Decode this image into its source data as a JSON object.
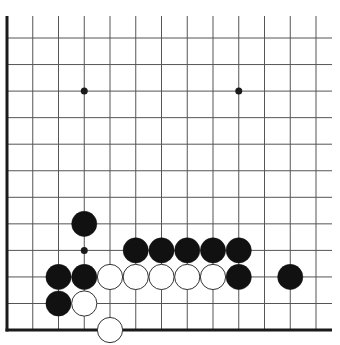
{
  "diagram": {
    "type": "go-board-fragment",
    "colors": {
      "background": "#ffffff",
      "line": "#555555",
      "edge": "#1a1a1a",
      "black_stone": "#111111",
      "white_stone": "#ffffff",
      "white_outline": "#333333"
    },
    "grid": {
      "x0": 7,
      "dx": 25.75,
      "cols": 13,
      "y0": 38,
      "dy": 26.55,
      "rows": 12,
      "top_extend": 16,
      "right_extend": 332
    },
    "star_points": [
      {
        "col": 3,
        "row": 2
      },
      {
        "col": 9,
        "row": 2
      },
      {
        "col": 3,
        "row": 8
      }
    ],
    "stones": [
      {
        "color": "black",
        "col": 3,
        "row": 7
      },
      {
        "color": "black",
        "col": 5,
        "row": 8
      },
      {
        "color": "black",
        "col": 6,
        "row": 8
      },
      {
        "color": "black",
        "col": 7,
        "row": 8
      },
      {
        "color": "black",
        "col": 8,
        "row": 8
      },
      {
        "color": "black",
        "col": 9,
        "row": 8
      },
      {
        "color": "black",
        "col": 2,
        "row": 9
      },
      {
        "color": "black",
        "col": 3,
        "row": 9
      },
      {
        "color": "white",
        "col": 4,
        "row": 9
      },
      {
        "color": "white",
        "col": 5,
        "row": 9
      },
      {
        "color": "white",
        "col": 6,
        "row": 9
      },
      {
        "color": "white",
        "col": 7,
        "row": 9
      },
      {
        "color": "white",
        "col": 8,
        "row": 9
      },
      {
        "color": "black",
        "col": 9,
        "row": 9
      },
      {
        "color": "black",
        "col": 11,
        "row": 9
      },
      {
        "color": "black",
        "col": 2,
        "row": 10
      },
      {
        "color": "white",
        "col": 3,
        "row": 10
      },
      {
        "color": "white",
        "col": 4,
        "row": 11
      }
    ]
  }
}
